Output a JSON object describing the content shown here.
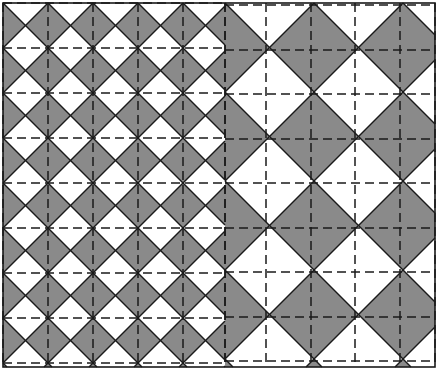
{
  "figure": {
    "canvas": {
      "width": 438,
      "height": 370
    },
    "frame": {
      "x": 3,
      "y": 3,
      "width": 432,
      "height": 364,
      "stroke_color": "#1a1a1a",
      "stroke_width": 1.6,
      "fill_color": "#ffffff"
    },
    "colors": {
      "shaded_triangle": "#8a8a8a",
      "unshaded_triangle": "#ffffff",
      "diagonal_line": "#1a1a1a",
      "dashed_grid_line": "#1a1a1a",
      "background": "#ffffff"
    },
    "line_styles": {
      "diagonal_stroke_width": 1.5,
      "dashed_stroke_width": 1.5,
      "dash_pattern": "9,5"
    },
    "regions": [
      {
        "name": "left-fine-region",
        "label": "Small scale tiling",
        "x": 3,
        "y": 3,
        "width": 222,
        "height": 364,
        "cell_size": 45,
        "columns": 5,
        "rows": 8,
        "scale_factor": 1,
        "shaded_triangles": [
          "left",
          "right"
        ],
        "unshaded_triangles": [
          "top",
          "bottom"
        ]
      },
      {
        "name": "right-coarse-region",
        "label": "Double scale tiling",
        "x": 225,
        "y": 3,
        "width": 210,
        "height": 364,
        "cell_size": 89,
        "columns": 3,
        "rows": 4,
        "scale_factor": 2,
        "shaded_triangles": [
          "left",
          "right"
        ],
        "unshaded_triangles": [
          "top",
          "bottom"
        ]
      }
    ],
    "grid_lines": {
      "left_region_vertical_x": [
        3,
        48,
        93,
        138,
        183,
        225
      ],
      "left_region_horizontal_y": [
        3,
        48,
        93,
        138,
        183,
        228,
        273,
        318,
        363
      ],
      "right_region_vertical_x": [
        225,
        266,
        311,
        355,
        400,
        435
      ],
      "right_region_horizontal_y": [
        5,
        50,
        94,
        139,
        183,
        228,
        272,
        317,
        361
      ]
    }
  }
}
